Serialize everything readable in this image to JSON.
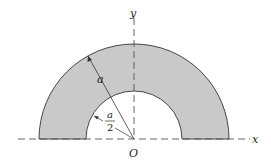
{
  "diagram": {
    "type": "semicircular-annulus",
    "labels": {
      "x_axis": "x",
      "y_axis": "y",
      "origin": "O",
      "outer_radius": "a",
      "inner_radius_num": "a",
      "inner_radius_den": "2"
    },
    "geometry": {
      "center": [
        134,
        139
      ],
      "outer_radius_px": 95,
      "inner_radius_px": 48
    },
    "colors": {
      "fill": "#c9c9c9",
      "stroke": "#333333",
      "axis": "#555555"
    }
  }
}
